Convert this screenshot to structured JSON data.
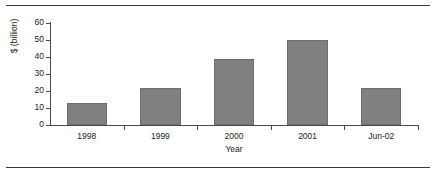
{
  "chart_data": {
    "type": "bar",
    "title": "",
    "subtitle": "",
    "xlabel": "Year",
    "ylabel": "$ (billion)",
    "categories": [
      "1998",
      "1999",
      "2000",
      "2001",
      "Jun-02"
    ],
    "values": [
      13,
      22,
      39,
      50,
      22
    ],
    "series": [
      {
        "name": "",
        "values": [
          13,
          22,
          39,
          50,
          22
        ]
      }
    ],
    "ylim": [
      0,
      60
    ],
    "yticks": [
      0,
      10,
      20,
      30,
      40,
      50,
      60
    ],
    "ytick_labels": [
      "0",
      "10",
      "20",
      "30",
      "40",
      "50",
      "60"
    ],
    "grid": false,
    "legend": false,
    "legend_position": "none",
    "bar_color": "#808080",
    "bar_edge_color": "#6e6e6e",
    "axis_color": "#4a4a4a",
    "text_color": "#1c1c1c",
    "background": "#ffffff",
    "frame_rule_color": "#3a3a3a"
  }
}
